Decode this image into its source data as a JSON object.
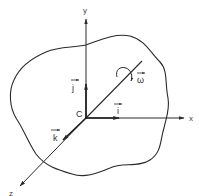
{
  "diagram": {
    "type": "rigid-body-rotation",
    "origin_label": "C",
    "axes": {
      "x": "x",
      "y": "y",
      "z": "z"
    },
    "unit_vectors": {
      "i": "i",
      "j": "j",
      "k": "k"
    },
    "angular_velocity": "ω",
    "colors": {
      "line": "#2a2a2a",
      "background": "#ffffff"
    }
  }
}
